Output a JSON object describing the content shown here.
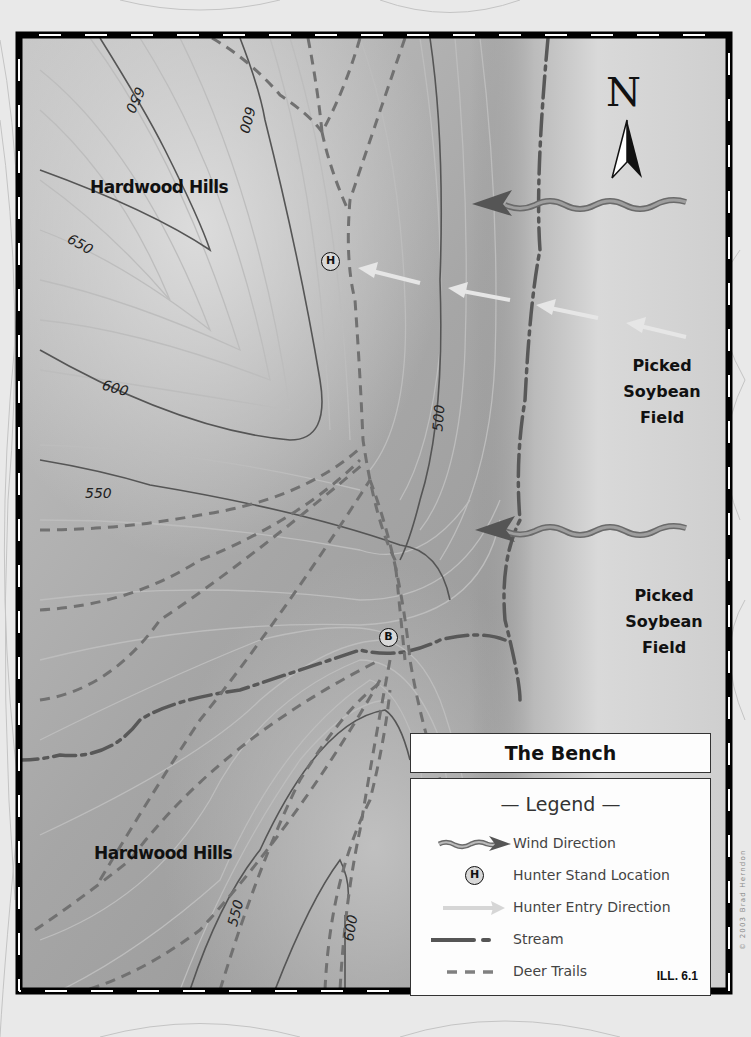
{
  "map": {
    "title": "The Bench",
    "illustration_id": "ILL. 6.1",
    "copyright": "© 2003 Brad Herndon",
    "compass_label": "N",
    "area_labels": {
      "hardwood_hills_north": "Hardwood Hills",
      "hardwood_hills_south": "Hardwood Hills",
      "soybean_field_north": [
        "Picked",
        "Soybean",
        "Field"
      ],
      "soybean_field_south": [
        "Picked",
        "Soybean",
        "Field"
      ]
    },
    "contour_labels": {
      "c650_top": "650",
      "c600_top": "600",
      "c650_left": "650",
      "c600_left": "600",
      "c550_left": "550",
      "c500": "500",
      "c550_bottom": "550",
      "c600_bottom": "600"
    },
    "markers": {
      "hunter_stand": "H",
      "bench": "B"
    }
  },
  "legend": {
    "title": "— Legend —",
    "items": [
      {
        "symbol": "wind-direction",
        "label": "Wind Direction"
      },
      {
        "symbol": "hunter-stand",
        "label": "Hunter Stand Location",
        "glyph": "H"
      },
      {
        "symbol": "hunter-entry",
        "label": "Hunter Entry Direction"
      },
      {
        "symbol": "stream",
        "label": "Stream"
      },
      {
        "symbol": "deer-trails",
        "label": "Deer Trails"
      }
    ]
  },
  "colors": {
    "map_dark": "#8f8f8f",
    "map_light": "#c9c9c9",
    "field": "#d2d2d2",
    "contour_major": "#555555",
    "contour_minor": "#bdbdbd",
    "deer_trail": "#707070",
    "stream": "#5a5a5a",
    "entry_arrow": "#e4e4e4",
    "wind_arrow": "#6d6d6d"
  }
}
